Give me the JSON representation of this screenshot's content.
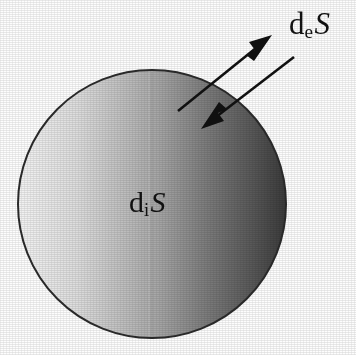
{
  "figure": {
    "name": "entropy-production-sphere-diagram",
    "background_color": "#fdfdfd",
    "width": 356,
    "height": 355
  },
  "sphere": {
    "name": "sphere-body",
    "center_x": 152,
    "center_y": 204,
    "radius": 134,
    "outline_color": "#2b2b2b",
    "outline_width": 2,
    "gradient": {
      "type": "linear-horizontal",
      "stops": [
        {
          "offset": "0%",
          "color": "#f2f2f2"
        },
        {
          "offset": "22%",
          "color": "#dcdcdc"
        },
        {
          "offset": "45%",
          "color": "#b4b4b4"
        },
        {
          "offset": "52%",
          "color": "#a6a6a6"
        },
        {
          "offset": "70%",
          "color": "#7c7c7c"
        },
        {
          "offset": "88%",
          "color": "#565656"
        },
        {
          "offset": "100%",
          "color": "#3a3a3a"
        }
      ],
      "seam_x": 152
    }
  },
  "labels": {
    "internal": {
      "name": "internal-entropy-label",
      "base": "d",
      "subscript": "i",
      "variable": "S",
      "full_text": "diS",
      "meaning": "internal entropy production",
      "x": 129,
      "y": 187,
      "font_size": 30,
      "color": "#121212"
    },
    "external": {
      "name": "external-entropy-label",
      "base": "d",
      "subscript": "e",
      "variable": "S",
      "full_text": "deS",
      "meaning": "entropy exchanged with surroundings",
      "x": 289,
      "y": 8,
      "font_size": 31,
      "color": "#121212"
    }
  },
  "arrows": [
    {
      "name": "outward-entropy-flow-arrow",
      "direction": "outward",
      "tail_x": 178,
      "tail_y": 111,
      "tip_x": 272,
      "tip_y": 35,
      "color": "#111111",
      "shaft_width": 2.6,
      "head_length": 26,
      "head_width": 13
    },
    {
      "name": "inward-entropy-flow-arrow",
      "direction": "inward",
      "tail_x": 294,
      "tail_y": 57,
      "tip_x": 201,
      "tip_y": 129,
      "color": "#111111",
      "shaft_width": 2.6,
      "head_length": 26,
      "head_width": 13
    }
  ],
  "colors": {
    "ink": "#121212",
    "page": "#fdfdfd",
    "sphere_light": "#f2f2f2",
    "sphere_dark": "#3a3a3a",
    "outline": "#2b2b2b"
  }
}
